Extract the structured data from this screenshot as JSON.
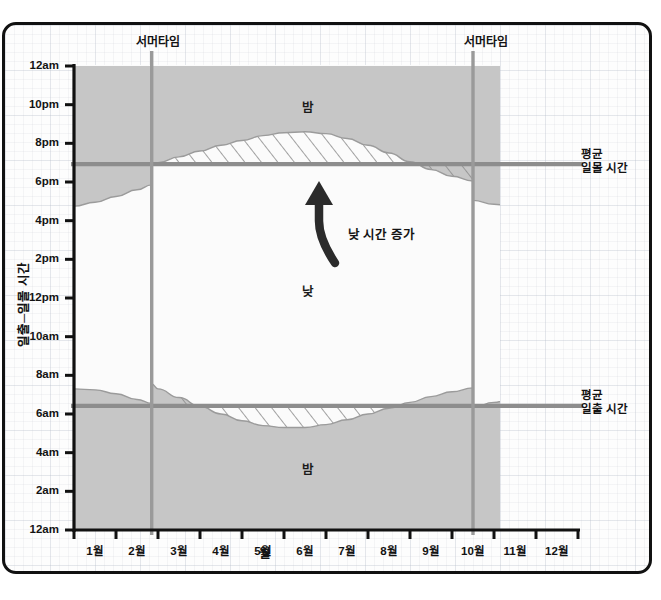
{
  "chart_data": {
    "type": "area",
    "title": "",
    "xlabel": "월",
    "ylabel": "일출─일몰 시간",
    "x_tick_labels": [
      "1월",
      "2월",
      "3월",
      "4월",
      "5월",
      "6월",
      "7월",
      "8월",
      "9월",
      "10월",
      "11월",
      "12월"
    ],
    "y_tick_labels": [
      "12am",
      "2am",
      "4am",
      "6am",
      "8am",
      "10am",
      "12pm",
      "2pm",
      "4pm",
      "6pm",
      "8pm",
      "10pm",
      "12am"
    ],
    "ylim_hours": [
      0,
      24
    ],
    "y_axis_inverted": true,
    "grid": true,
    "legend_position": "none",
    "colors": {
      "night_fill": "#c6c6c6",
      "day_fill": "#fbfbfb",
      "average_line": "#8d8d8d",
      "dst_line": "#9a9a9a",
      "axis": "#111111",
      "hatch": "#8a8a8a"
    },
    "annotations": [
      {
        "name": "night-top",
        "text": "밤",
        "x_month": 6.0,
        "y_hour": 22.2
      },
      {
        "name": "day-middle",
        "text": "낮",
        "x_month": 6.0,
        "y_hour": 13.0
      },
      {
        "name": "night-bottom",
        "text": "밤",
        "x_month": 6.0,
        "y_hour": 2.4
      },
      {
        "name": "daylight-increase-arrow",
        "text": "낮 시간 증가",
        "x_month": 6.9,
        "y_hour": 17.4
      }
    ],
    "vertical_markers": [
      {
        "name": "dst-spring",
        "label": "서머타임",
        "x_month": 2.85
      },
      {
        "name": "dst-fall",
        "label": "서머타임",
        "x_month": 10.5
      }
    ],
    "horizontal_markers": [
      {
        "name": "average-sunset",
        "label": "평균\n일몰 시간",
        "label_line1": "평균",
        "label_line2": "일몰 시간",
        "y_hour": 18.92
      },
      {
        "name": "average-sunrise",
        "label": "평균\n일출 시간",
        "label_line1": "평균",
        "label_line2": "일출 시간",
        "y_hour": 6.42
      }
    ],
    "series": [
      {
        "name": "일몰 시간",
        "description": "sunset time curve (hours, 24h clock) sampled monthly at month starts",
        "x": [
          1.0,
          1.5,
          2.0,
          2.5,
          2.85,
          2.851,
          3.0,
          3.5,
          4.0,
          4.5,
          5.0,
          5.5,
          6.0,
          6.5,
          7.0,
          7.5,
          8.0,
          8.5,
          9.0,
          9.5,
          10.0,
          10.5,
          10.501,
          11.0,
          11.5,
          12.0,
          12.5,
          13.0
        ],
        "values": [
          16.75,
          16.95,
          17.25,
          17.6,
          17.85,
          18.85,
          19.0,
          19.3,
          19.6,
          19.9,
          20.15,
          20.4,
          20.55,
          20.6,
          20.5,
          20.25,
          19.9,
          19.5,
          19.05,
          18.65,
          18.3,
          18.05,
          17.05,
          16.85,
          16.7,
          16.65,
          16.72,
          16.85
        ]
      },
      {
        "name": "일출 시간",
        "description": "sunrise time curve (hours, 24h clock) sampled monthly at month starts",
        "x": [
          1.0,
          1.5,
          2.0,
          2.5,
          2.85,
          2.851,
          3.0,
          3.5,
          4.0,
          4.5,
          5.0,
          5.5,
          6.0,
          6.5,
          7.0,
          7.5,
          8.0,
          8.5,
          9.0,
          9.5,
          10.0,
          10.5,
          10.501,
          11.0,
          11.5,
          12.0,
          12.5,
          13.0
        ],
        "values": [
          7.3,
          7.25,
          7.05,
          6.75,
          6.55,
          7.55,
          7.3,
          6.85,
          6.4,
          6.0,
          5.65,
          5.4,
          5.3,
          5.3,
          5.45,
          5.7,
          6.0,
          6.3,
          6.6,
          6.9,
          7.15,
          7.35,
          6.35,
          6.6,
          6.9,
          7.15,
          7.3,
          7.35
        ]
      }
    ],
    "hatched_regions": [
      {
        "name": "extra-evening-daylight",
        "between": "average-sunset and sunset curve",
        "x_from_month": 2.85,
        "x_to_month": 10.5
      },
      {
        "name": "extra-morning-daylight",
        "between": "sunrise curve and average-sunrise",
        "x_from_month": 3.2,
        "x_to_month": 8.9
      }
    ]
  },
  "axes": {
    "y_title": "일출─일몰 시간",
    "x_title": "월"
  }
}
